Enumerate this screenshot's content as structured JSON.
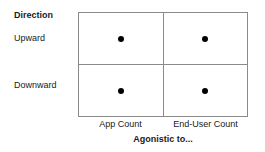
{
  "chart_data": {
    "type": "table",
    "title": "",
    "xlabel": "Agonistic to...",
    "ylabel": "Direction",
    "categories": [
      "App Count",
      "End-User Count"
    ],
    "rows": [
      "Upward",
      "Downward"
    ],
    "grid": true,
    "legend": "none",
    "marker": "filled-circle",
    "cells": [
      {
        "row": "Upward",
        "column": "App Count",
        "marker": true
      },
      {
        "row": "Upward",
        "column": "End-User Count",
        "marker": true
      },
      {
        "row": "Downward",
        "column": "App Count",
        "marker": true
      },
      {
        "row": "Downward",
        "column": "End-User Count",
        "marker": true
      }
    ],
    "values": [
      [
        1,
        1
      ],
      [
        1,
        1
      ]
    ]
  },
  "matrix": {
    "row_axis_title": "Direction",
    "row_labels": [
      {
        "label": "Upward"
      },
      {
        "label": "Downward"
      }
    ],
    "column_labels": [
      {
        "label": "App Count"
      },
      {
        "label": "End-User Count"
      }
    ],
    "column_axis_title": "Agonistic to...",
    "border_color": "#8a8a8a",
    "marker_color": "#000000",
    "text_color": "#1a1a1a",
    "background": "#ffffff"
  }
}
